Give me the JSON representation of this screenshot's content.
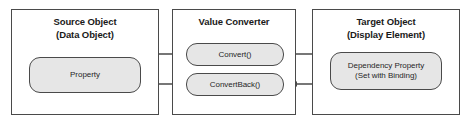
{
  "diagram": {
    "colors": {
      "background": "#ffffff",
      "box_border": "#4a4a4a",
      "node_fill": "#e6e6e6",
      "node_border": "#4a4a4a",
      "arrow": "#4a4a4a",
      "text": "#1a1a1a"
    },
    "boxes": [
      {
        "id": "source-object",
        "title_line1": "Source Object",
        "title_line2": "(Data Object)",
        "node": {
          "id": "property",
          "label_line1": "Property",
          "label_line2": ""
        }
      },
      {
        "id": "value-converter",
        "title_line1": "Value Converter",
        "title_line2": "",
        "nodes": [
          {
            "id": "convert",
            "label": "Convert()"
          },
          {
            "id": "convert-back",
            "label": "ConvertBack()"
          }
        ]
      },
      {
        "id": "target-object",
        "title_line1": "Target Object",
        "title_line2": "(Display Element)",
        "node": {
          "id": "dependency-property",
          "label_line1": "Dependency Property",
          "label_line2": "(Set with Binding)"
        }
      }
    ],
    "arrows": [
      {
        "id": "property-to-convert",
        "from": "property",
        "to": "convert",
        "direction": "right"
      },
      {
        "id": "convert-to-dependency-property",
        "from": "convert",
        "to": "dependency-property",
        "direction": "right"
      },
      {
        "id": "dependency-property-to-convert-back",
        "from": "dependency-property",
        "to": "convert-back",
        "direction": "left"
      },
      {
        "id": "convert-back-to-property",
        "from": "convert-back",
        "to": "property",
        "direction": "left"
      }
    ]
  }
}
